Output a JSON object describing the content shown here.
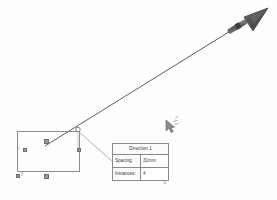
{
  "app": {
    "title": "Linear Pattern Sketch",
    "background_color": "#ffffff"
  },
  "colors": {
    "sketch_line": "#7a7a7a",
    "direction_line": "#5a5a5a",
    "arrow_head": "#595959",
    "dialog_border": "#8a8a8a",
    "dialog_background": "#fdfdfd",
    "glyph": "#9a9a9a",
    "text": "#3a3a3a"
  },
  "callout": {
    "name": "direction-callout",
    "title": "Direction 1",
    "rows": [
      {
        "label": "Spacing:",
        "value": "31mm"
      },
      {
        "label": "Instances:",
        "value": "4"
      }
    ]
  },
  "canvas": {
    "rectangle": {
      "name": "sketch-rectangle",
      "x": 17,
      "y": 131,
      "width": 62,
      "height": 40
    },
    "direction_arrow": {
      "name": "direction-arrow",
      "start_x": 45,
      "start_y": 146,
      "end_x": 250,
      "end_y": 20,
      "label": "pattern direction"
    },
    "origin_node": {
      "name": "pattern-origin-node",
      "x": 78,
      "y": 129
    },
    "leader_line": {
      "name": "callout-leader-line",
      "from_x": 78,
      "from_y": 130,
      "to_x": 112,
      "to_y": 160
    },
    "cursor": {
      "name": "mouse-cursor",
      "x": 168,
      "y": 122
    },
    "chevron": {
      "name": "chevron-up-icon",
      "glyph": "˄",
      "x": 163,
      "y": 181
    },
    "constraint_glyphs": [
      {
        "name": "constraint-glyph-top-mid",
        "x": 44,
        "y": 139
      },
      {
        "name": "constraint-glyph-left-mid",
        "x": 23,
        "y": 148
      },
      {
        "name": "constraint-glyph-right-mid",
        "x": 77,
        "y": 148
      },
      {
        "name": "constraint-glyph-bottom-left",
        "x": 16,
        "y": 174
      },
      {
        "name": "constraint-glyph-bottom-mid",
        "x": 44,
        "y": 174
      }
    ]
  }
}
